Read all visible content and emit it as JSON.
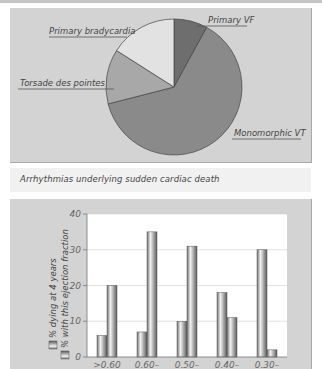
{
  "chart_data": [
    {
      "type": "pie",
      "title": "Arrhythmias underlying sudden cardiac death",
      "categories": [
        "Primary VF",
        "Monomorphic VT",
        "Torsade des pointes",
        "Primary bradycardia"
      ],
      "values": [
        8,
        63,
        13,
        16
      ],
      "colors": [
        "#6e6e6e",
        "#8a8a8a",
        "#a8a8a8",
        "#e2e2e2"
      ]
    },
    {
      "type": "bar",
      "title": "",
      "categories": [
        ">0.60",
        "0.60–",
        "0.50–",
        "0.40–",
        "0.30–"
      ],
      "series": [
        {
          "name": "% dying at 4 years",
          "values": [
            6,
            7,
            10,
            18,
            30
          ]
        },
        {
          "name": "% with this ejection fraction",
          "values": [
            20,
            35,
            31,
            11,
            2
          ]
        }
      ],
      "xlabel": "",
      "ylabel": "",
      "yticks": [
        0,
        10,
        20,
        30,
        40
      ],
      "ylim": [
        0,
        40
      ],
      "grid": true,
      "legend_position": "left, rotated vertical"
    }
  ],
  "pie": {
    "labels": {
      "primary_vf": "Primary VF",
      "monomorphic_vt": "Monomorphic VT",
      "torsade": "Torsade des pointes",
      "bradycardia": "Primary bradycardia"
    }
  },
  "caption": "Arrhythmias underlying sudden cardiac death",
  "bar": {
    "legend": [
      "% dying at 4 years",
      "% with this ejection fraction"
    ],
    "yticks": [
      "0",
      "10",
      "20",
      "30",
      "40"
    ],
    "xticks": [
      ">0.60",
      "0.60–",
      "0.50–",
      "0.40–",
      "0.30–"
    ]
  }
}
